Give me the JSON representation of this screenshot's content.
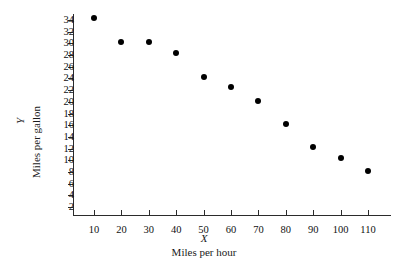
{
  "chart_data": {
    "type": "scatter",
    "title": "",
    "xlabel": "Miles per hour",
    "ylabel": "Miles per gallon",
    "x_symbol": "X",
    "y_symbol": "Y",
    "xlim": [
      0,
      120
    ],
    "ylim": [
      0,
      35
    ],
    "grid": false,
    "legend": null,
    "x_ticks": [
      10,
      20,
      30,
      40,
      50,
      60,
      70,
      80,
      90,
      100,
      110
    ],
    "y_ticks": [
      2,
      4,
      6,
      8,
      10,
      12,
      14,
      16,
      18,
      20,
      22,
      24,
      26,
      28,
      30,
      32,
      34
    ],
    "marker_color": "#000000",
    "axis_color": "#2b2b2b",
    "points": [
      {
        "x": 10,
        "y": 34.3
      },
      {
        "x": 20,
        "y": 30.3
      },
      {
        "x": 30,
        "y": 30.3
      },
      {
        "x": 40,
        "y": 28.3
      },
      {
        "x": 50,
        "y": 24.2
      },
      {
        "x": 60,
        "y": 22.5
      },
      {
        "x": 70,
        "y": 20.1
      },
      {
        "x": 80,
        "y": 16.2
      },
      {
        "x": 90,
        "y": 12.3
      },
      {
        "x": 100,
        "y": 10.4
      },
      {
        "x": 110,
        "y": 8.2
      }
    ]
  }
}
